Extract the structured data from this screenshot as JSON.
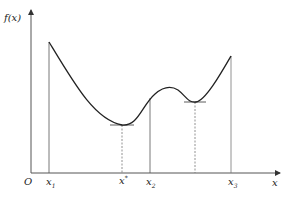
{
  "diagram": {
    "y_axis_label": "f(x)",
    "x_axis_label": "x",
    "origin_label": "O",
    "ticks": [
      {
        "name": "x",
        "sub": "1",
        "sup": ""
      },
      {
        "name": "x",
        "sub": "",
        "sup": "*"
      },
      {
        "name": "x",
        "sub": "2",
        "sup": ""
      },
      {
        "name": "x",
        "sub": "3",
        "sup": ""
      }
    ],
    "colors": {
      "curve": "#222222",
      "axis": "#444444",
      "guide": "#555555"
    }
  }
}
